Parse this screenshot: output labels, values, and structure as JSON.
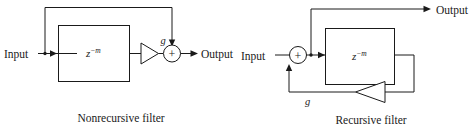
{
  "figure": {
    "background_color": "#ffffff",
    "line_color": "#1a1a1a",
    "width": 475,
    "height": 129
  },
  "nonrecursive": {
    "caption": "Nonrecursive filter",
    "input_label": "Input",
    "output_label": "Output",
    "delay_block": {
      "base": "z",
      "exponent": "−m"
    },
    "gain_label": "g",
    "summer_symbol": "+",
    "icons": {
      "gain": "triangle-amplifier-icon",
      "summer": "summing-junction-icon",
      "tap": "junction-dot-icon"
    }
  },
  "recursive": {
    "caption": "Recursive filter",
    "input_label": "Input",
    "output_label": "Output",
    "delay_block": {
      "base": "z",
      "exponent": "−m"
    },
    "gain_label": "g",
    "summer_symbol": "+",
    "icons": {
      "gain": "triangle-amplifier-icon",
      "summer": "summing-junction-icon",
      "tap": "junction-dot-icon"
    }
  }
}
